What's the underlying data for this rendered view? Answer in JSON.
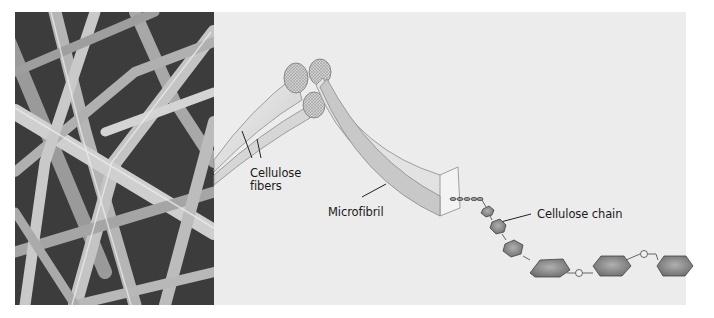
{
  "figure": {
    "photo": {
      "description": "Scanning electron micrograph of cellulose fibers"
    },
    "labels": {
      "cellulose_fibers_line1": "Cellulose",
      "cellulose_fibers_line2": "fibers",
      "microfibril": "Microfibril",
      "cellulose_chain": "Cellulose chain"
    },
    "chain_linker": "O",
    "colors": {
      "panel_bg": "#ececec",
      "fiber_fill": "#dcdcdc",
      "cross_section": "#c8c8c8",
      "glucose_ring": "#8a8a8a",
      "photo_dark": "#4a4a4a"
    }
  }
}
